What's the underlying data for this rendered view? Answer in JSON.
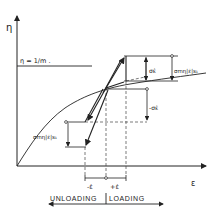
{
  "axes": {
    "y_label": "η",
    "x_label": "ε"
  },
  "reference_line": {
    "label": "η = 1/m ."
  },
  "annotations": {
    "delta_top": "σε̇",
    "delta_top_right": "σmη|ε̇|s₁",
    "delta_right_neg": "-σε̇",
    "delta_left": "σmη|ε̇|s₁",
    "neg_rate": "-ε̇",
    "pos_rate": "+ε̇"
  },
  "footer": {
    "unloading": "UNLOADING",
    "loading": "LOADING"
  },
  "colors": {
    "ink": "#222222",
    "background": "#ffffff"
  }
}
